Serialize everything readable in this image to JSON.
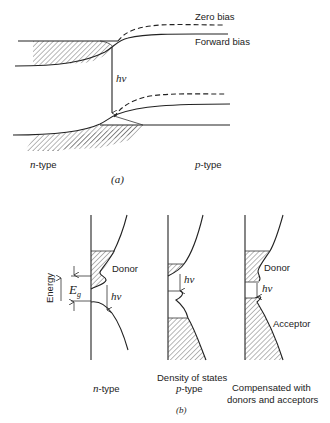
{
  "figure_a": {
    "legend": {
      "zero_bias": "Zero bias",
      "forward_bias": "Forward bias"
    },
    "transition_label": "hν",
    "left_label_italic": "n",
    "left_label_rest": "-type",
    "right_label_italic": "p",
    "right_label_rest": "-type",
    "caption": "(a)"
  },
  "figure_b": {
    "axis_label": "Energy",
    "gap_label_main": "E",
    "gap_label_sub": "g",
    "panels": [
      {
        "id": "n-type",
        "band_label": "Donor",
        "transition_label": "hν",
        "caption_italic": "n",
        "caption_rest": "-type"
      },
      {
        "id": "p-type",
        "transition_label": "hν",
        "caption_top": "Density of states",
        "caption_italic": "p",
        "caption_rest": "-type"
      },
      {
        "id": "compensated",
        "band_label_top": "Donor",
        "band_label_bottom": "Acceptor",
        "transition_label": "hν",
        "caption_line1": "Compensated with",
        "caption_line2": "donors and acceptors"
      }
    ],
    "caption": "(b)"
  }
}
